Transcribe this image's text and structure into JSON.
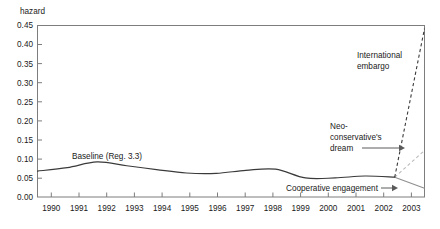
{
  "chart_data": {
    "type": "line",
    "title": "",
    "xlabel": "",
    "ylabel": "hazard",
    "ylim": [
      0.0,
      0.45
    ],
    "xlim": [
      1990,
      2003
    ],
    "grid": false,
    "legend": "annotations-inline",
    "ytick_labels": [
      "0.45",
      "0.40",
      "0.35",
      "0.30",
      "0.25",
      "0.20",
      "0.15",
      "0.10",
      "0.05",
      "0.00"
    ],
    "ytick_values": [
      0.45,
      0.4,
      0.35,
      0.3,
      0.25,
      0.2,
      0.15,
      0.1,
      0.05,
      0.0
    ],
    "xtick_labels": [
      "1990",
      "1991",
      "1992",
      "1993",
      "1994",
      "1995",
      "1996",
      "1997",
      "1998",
      "1999",
      "2000",
      "2001",
      "2002",
      "2003"
    ],
    "xtick_values": [
      1990,
      1991,
      1992,
      1993,
      1994,
      1995,
      1996,
      1997,
      1998,
      1999,
      2000,
      2001,
      2002,
      2003
    ],
    "series": [
      {
        "name": "Baseline (Reg. 3.3)",
        "style": "solid-black",
        "color": "#3a3a3a",
        "x": [
          1990,
          1991,
          1992,
          1993,
          1994,
          1995,
          1996,
          1997,
          1998,
          1999,
          2000,
          2001,
          2002
        ],
        "values": [
          0.068,
          0.077,
          0.092,
          0.082,
          0.072,
          0.063,
          0.062,
          0.07,
          0.073,
          0.05,
          0.05,
          0.055,
          0.052
        ]
      },
      {
        "name": "International embargo",
        "style": "dashed-black",
        "color": "#3a3a3a",
        "x": [
          2002,
          2003
        ],
        "values": [
          0.052,
          0.442
        ]
      },
      {
        "name": "Neo-conservative's dream",
        "style": "dashed-gray",
        "color": "#b9b9b9",
        "x": [
          2002,
          2003
        ],
        "values": [
          0.052,
          0.122
        ]
      },
      {
        "name": "Cooperative engagement",
        "style": "solid-gray",
        "color": "#8f8f8f",
        "x": [
          2002,
          2003
        ],
        "values": [
          0.052,
          0.023
        ]
      }
    ],
    "annotations": [
      {
        "id": "baseline",
        "text": "Baseline (Reg. 3.3)",
        "lines": [
          "Baseline (Reg. 3.3)"
        ],
        "arrow": false
      },
      {
        "id": "embargo",
        "text": "International embargo",
        "lines": [
          "International",
          "embargo"
        ],
        "arrow": false
      },
      {
        "id": "neocon",
        "text": "Neo-conservative's dream",
        "lines": [
          "Neo-",
          "conservative's",
          "dream"
        ],
        "arrow": true
      },
      {
        "id": "coop",
        "text": "Cooperative engagement",
        "lines": [
          "Cooperative engagement"
        ],
        "arrow": true
      }
    ]
  }
}
